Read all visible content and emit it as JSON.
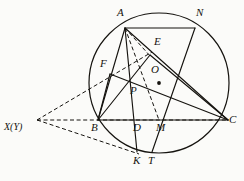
{
  "figure": {
    "type": "euclidean-geometry-diagram",
    "canvas": {
      "width": 244,
      "height": 181
    },
    "style": {
      "background": "#fbfbf9",
      "stroke": "#15130f",
      "solid_width": 1.1,
      "dashed_width": 1.0,
      "dash_pattern": "4,2.6"
    },
    "circle": {
      "name": "circumcircle",
      "cx": 159,
      "cy": 83,
      "r": 70,
      "center_label": "O",
      "center_dot_r": 1.9
    },
    "points": [
      {
        "id": "A",
        "label": "A",
        "x": 125,
        "y": 28,
        "lx": 117,
        "ly": 12
      },
      {
        "id": "N",
        "label": "N",
        "x": 195,
        "y": 28,
        "lx": 196,
        "ly": 12
      },
      {
        "id": "E",
        "label": "E",
        "x": 150,
        "y": 55,
        "lx": 154,
        "ly": 40
      },
      {
        "id": "O",
        "label": "O",
        "x": 159,
        "y": 83,
        "lx": 151,
        "ly": 67
      },
      {
        "id": "F",
        "label": "F",
        "x": 112,
        "y": 77,
        "lx": 101,
        "ly": 62
      },
      {
        "id": "P",
        "label": "P",
        "x": 128,
        "y": 82,
        "lx": 130,
        "ly": 87
      },
      {
        "id": "B",
        "label": "B",
        "x": 98,
        "y": 120,
        "lx": 92,
        "ly": 124
      },
      {
        "id": "D",
        "label": "D",
        "x": 135,
        "y": 120,
        "lx": 134,
        "ly": 124
      },
      {
        "id": "M",
        "label": "M",
        "x": 159,
        "y": 120,
        "lx": 157,
        "ly": 124
      },
      {
        "id": "C",
        "label": "C",
        "x": 228,
        "y": 120,
        "lx": 229,
        "ly": 117
      },
      {
        "id": "K",
        "label": "K",
        "x": 137,
        "y": 152,
        "lx": 134,
        "ly": 157
      },
      {
        "id": "T",
        "label": "T",
        "x": 152,
        "y": 152,
        "lx": 149,
        "ly": 157
      },
      {
        "id": "X",
        "label": "X(Y)",
        "x": 37,
        "y": 120,
        "lx": 5,
        "ly": 124
      }
    ],
    "solid_segments": [
      {
        "name": "segment-A-N",
        "from": "A",
        "to": "N"
      },
      {
        "name": "segment-A-B",
        "from": "A",
        "to": "B"
      },
      {
        "name": "segment-A-K",
        "from": "A",
        "to": "K"
      },
      {
        "name": "segment-A-C",
        "from": "A",
        "to": "C"
      },
      {
        "name": "segment-B-C",
        "from": "B",
        "to": "C"
      },
      {
        "name": "segment-F-C",
        "from": "F",
        "to": "C"
      },
      {
        "name": "segment-B-E",
        "from": "B",
        "to": "E"
      },
      {
        "name": "segment-F-P-B",
        "from": "F",
        "to": "B"
      },
      {
        "name": "segment-N-M-T",
        "from": "N",
        "to": "T"
      },
      {
        "name": "segment-E-C",
        "from": "E",
        "to": "C"
      }
    ],
    "dashed_segments": [
      {
        "name": "dashed-A-M",
        "from": "A",
        "to": "M"
      },
      {
        "name": "dashed-A-E",
        "from": "A",
        "to": "E"
      },
      {
        "name": "dashed-X-E",
        "from": "X",
        "to": "E"
      },
      {
        "name": "dashed-X-C",
        "from": "X",
        "to": "C"
      },
      {
        "name": "dashed-X-K",
        "from": "X",
        "to": "K"
      }
    ]
  }
}
